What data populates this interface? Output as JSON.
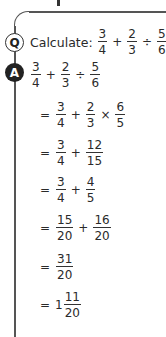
{
  "question": {
    "badge": "Q",
    "label": "Calculate:",
    "expr": [
      {
        "t": "frac",
        "n": "3",
        "d": "4"
      },
      {
        "t": "op",
        "v": "+"
      },
      {
        "t": "frac",
        "n": "2",
        "d": "3"
      },
      {
        "t": "op",
        "v": "÷"
      },
      {
        "t": "frac",
        "n": "5",
        "d": "6"
      }
    ]
  },
  "answer": {
    "badge": "A",
    "steps": [
      {
        "eq": "",
        "expr": [
          {
            "t": "frac",
            "n": "3",
            "d": "4"
          },
          {
            "t": "op",
            "v": "+"
          },
          {
            "t": "frac",
            "n": "2",
            "d": "3"
          },
          {
            "t": "op",
            "v": "÷"
          },
          {
            "t": "frac",
            "n": "5",
            "d": "6"
          }
        ]
      },
      {
        "eq": "=",
        "expr": [
          {
            "t": "frac",
            "n": "3",
            "d": "4"
          },
          {
            "t": "op",
            "v": "+"
          },
          {
            "t": "frac",
            "n": "2",
            "d": "3"
          },
          {
            "t": "op",
            "v": "×"
          },
          {
            "t": "frac",
            "n": "6",
            "d": "5"
          }
        ]
      },
      {
        "eq": "=",
        "expr": [
          {
            "t": "frac",
            "n": "3",
            "d": "4"
          },
          {
            "t": "op",
            "v": "+"
          },
          {
            "t": "frac",
            "n": "12",
            "d": "15"
          }
        ]
      },
      {
        "eq": "=",
        "expr": [
          {
            "t": "frac",
            "n": "3",
            "d": "4"
          },
          {
            "t": "op",
            "v": "+"
          },
          {
            "t": "frac",
            "n": "4",
            "d": "5"
          }
        ]
      },
      {
        "eq": "=",
        "expr": [
          {
            "t": "frac",
            "n": "15",
            "d": "20"
          },
          {
            "t": "op",
            "v": "+"
          },
          {
            "t": "frac",
            "n": "16",
            "d": "20"
          }
        ]
      },
      {
        "eq": "=",
        "expr": [
          {
            "t": "frac",
            "n": "31",
            "d": "20"
          }
        ]
      },
      {
        "eq": "=",
        "expr": [
          {
            "t": "whole",
            "v": "1"
          },
          {
            "t": "frac",
            "n": "11",
            "d": "20"
          }
        ]
      }
    ]
  }
}
